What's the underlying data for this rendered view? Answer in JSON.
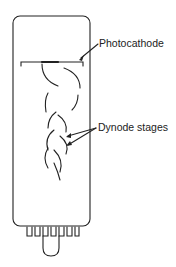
{
  "diagram": {
    "labels": {
      "photocathode": "Photocathode",
      "dynode_stages": "Dynode stages"
    },
    "colors": {
      "line": "#222222",
      "background": "#ffffff"
    }
  }
}
